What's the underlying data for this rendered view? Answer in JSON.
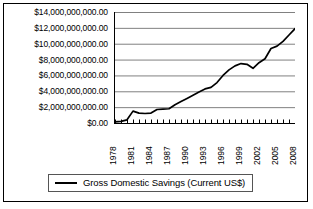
{
  "chart_data": {
    "type": "line",
    "title": "",
    "subtitle": "",
    "xlabel": "",
    "ylabel": "",
    "grid": true,
    "legend_position": "bottom-center",
    "ylim": [
      0,
      14000000000
    ],
    "ytick_labels": [
      "$14,000,000,000.00",
      "$12,000,000,000.00",
      "$10,000,000,000.00",
      "$8,000,000,000.00",
      "$6,000,000,000.00",
      "$4,000,000,000.00",
      "$2,000,000,000.00",
      "$0.00"
    ],
    "ytick_values": [
      14000000000,
      12000000000,
      10000000000,
      8000000000,
      6000000000,
      4000000000,
      2000000000,
      0
    ],
    "xlim": [
      1978,
      2008
    ],
    "xtick_labels_all": [
      "1978",
      "1979",
      "1980",
      "1981",
      "1982",
      "1983",
      "1984",
      "1985",
      "1986",
      "1987",
      "1988",
      "1989",
      "1990",
      "1991",
      "1992",
      "1993",
      "1994",
      "1995",
      "1996",
      "1997",
      "1998",
      "1999",
      "2000",
      "2001",
      "2002",
      "2003",
      "2004",
      "2005",
      "2006",
      "2007",
      "2008"
    ],
    "xtick_labels_shown": [
      "1978",
      "1981",
      "1984",
      "1987",
      "1990",
      "1993",
      "1996",
      "1999",
      "2002",
      "2005",
      "2008"
    ],
    "xtick_label_rotation": -90,
    "series": [
      {
        "name": "Gross Domestic Savings (Current US$)",
        "color": "#000000",
        "x": [
          1978,
          1979,
          1980,
          1981,
          1982,
          1983,
          1984,
          1985,
          1986,
          1987,
          1988,
          1989,
          1990,
          1991,
          1992,
          1993,
          1994,
          1995,
          1996,
          1997,
          1998,
          1999,
          2000,
          2001,
          2002,
          2003,
          2004,
          2005,
          2006,
          2007,
          2008
        ],
        "values": [
          150000000,
          200000000,
          400000000,
          1500000000,
          1250000000,
          1200000000,
          1250000000,
          1700000000,
          1750000000,
          1800000000,
          2300000000,
          2700000000,
          3100000000,
          3500000000,
          3900000000,
          4300000000,
          4500000000,
          5100000000,
          6000000000,
          6700000000,
          7200000000,
          7500000000,
          7400000000,
          6900000000,
          7600000000,
          8100000000,
          9400000000,
          9700000000,
          10300000000,
          11100000000,
          11900000000
        ]
      }
    ]
  },
  "legend": {
    "entries": [
      {
        "label": "Gross Domestic Savings (Current US$)"
      }
    ]
  }
}
